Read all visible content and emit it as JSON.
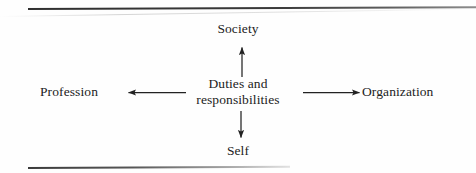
{
  "figure": {
    "type": "radial-relationship-diagram",
    "center": {
      "line1": "Duties and",
      "line2": "responsibilities"
    },
    "nodes": [
      {
        "id": "society",
        "label": "Society",
        "direction": "up"
      },
      {
        "id": "organization",
        "label": "Organization",
        "direction": "right"
      },
      {
        "id": "self",
        "label": "Self",
        "direction": "down"
      },
      {
        "id": "profession",
        "label": "Profession",
        "direction": "left"
      }
    ],
    "arrows": [
      {
        "from": "center",
        "to": "society",
        "direction": "up",
        "style": "solid-single-head"
      },
      {
        "from": "center",
        "to": "organization",
        "direction": "right",
        "style": "solid-single-head"
      },
      {
        "from": "center",
        "to": "self",
        "direction": "down",
        "style": "solid-single-head"
      },
      {
        "from": "center",
        "to": "profession",
        "direction": "left",
        "style": "solid-single-head"
      }
    ],
    "rules": {
      "top": "horizontal-rule",
      "bottom": "horizontal-rule"
    },
    "colors": {
      "ink": "#222222",
      "rule": "#3b3b3b",
      "background": "#fefefe"
    }
  }
}
